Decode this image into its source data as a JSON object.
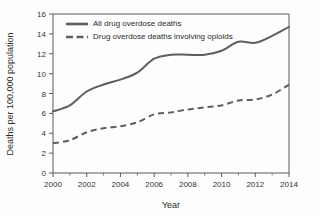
{
  "chart_data": {
    "type": "line",
    "title": "",
    "xlabel": "Year",
    "ylabel": "Deaths per 100,000 population",
    "x": [
      2000,
      2001,
      2002,
      2003,
      2004,
      2005,
      2006,
      2007,
      2008,
      2009,
      2010,
      2011,
      2012,
      2013,
      2014
    ],
    "xlim": [
      2000,
      2014
    ],
    "ylim": [
      0,
      16
    ],
    "xticks": [
      2000,
      2002,
      2004,
      2006,
      2008,
      2010,
      2012,
      2014
    ],
    "xtick_labels": [
      "2000",
      "2002",
      "2004",
      "2006",
      "2008",
      "2010",
      "2012",
      "2014"
    ],
    "xticks_minor": [
      2001,
      2003,
      2005,
      2007,
      2009,
      2011,
      2013
    ],
    "yticks": [
      0,
      2,
      4,
      6,
      8,
      10,
      12,
      14,
      16
    ],
    "ytick_labels": [
      "0",
      "2",
      "4",
      "6",
      "8",
      "10",
      "12",
      "14",
      "16"
    ],
    "grid": false,
    "legend_position": "top-left",
    "series": [
      {
        "name": "All drug overdose deaths",
        "style": "solid",
        "color": "#5e5e5e",
        "values": [
          6.2,
          6.8,
          8.2,
          8.9,
          9.4,
          10.1,
          11.5,
          11.9,
          11.9,
          11.9,
          12.3,
          13.2,
          13.1,
          13.8,
          14.7
        ]
      },
      {
        "name": "Drug overdose deaths involving opioids",
        "style": "dashed",
        "color": "#5e5e5e",
        "values": [
          3.0,
          3.3,
          4.1,
          4.5,
          4.7,
          5.1,
          5.9,
          6.1,
          6.4,
          6.6,
          6.8,
          7.3,
          7.4,
          7.9,
          8.9
        ]
      }
    ]
  },
  "legend": {
    "items": [
      {
        "label": "All drug overdose deaths",
        "style": "solid"
      },
      {
        "label": "Drug overdose deaths involving opioids",
        "style": "dashed"
      }
    ]
  }
}
